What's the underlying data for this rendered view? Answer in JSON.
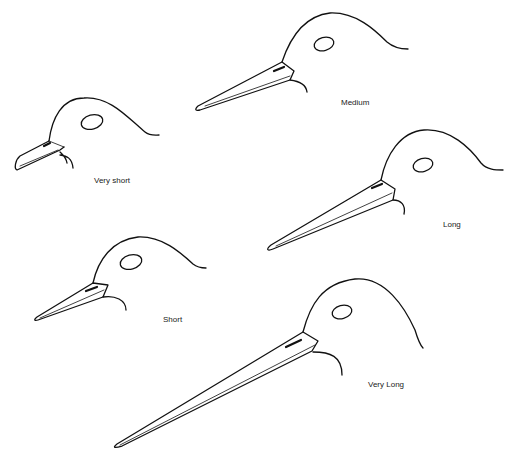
{
  "diagram": {
    "type": "bill-length comparison",
    "heads": [
      {
        "id": "very-short",
        "label": "Very short"
      },
      {
        "id": "medium",
        "label": "Medium"
      },
      {
        "id": "long",
        "label": "Long"
      },
      {
        "id": "short",
        "label": "Short"
      },
      {
        "id": "very-long",
        "label": "Very Long"
      }
    ]
  }
}
